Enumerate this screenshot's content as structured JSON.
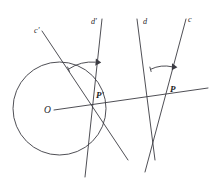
{
  "figure": {
    "width": 218,
    "height": 182,
    "background": "#ffffff",
    "stroke_color": "#3b3b42",
    "label_color": "#26262b"
  },
  "labels": {
    "line_c_prime": "c'",
    "line_d_prime": "d'",
    "line_d": "d",
    "line_c": "c",
    "point_o": "O",
    "point_p_prime": "P'",
    "point_p": "P"
  },
  "label_positions": {
    "line_c_prime": {
      "x": 34,
      "y": 33
    },
    "line_d_prime": {
      "x": 91,
      "y": 24
    },
    "line_d": {
      "x": 143,
      "y": 24
    },
    "line_c": {
      "x": 188,
      "y": 22
    },
    "point_o": {
      "x": 44,
      "y": 113
    },
    "point_p_prime": {
      "x": 96,
      "y": 98
    },
    "point_p": {
      "x": 170,
      "y": 92
    }
  },
  "geometry": {
    "circle": {
      "name": "circle-O",
      "center_x": 59.5,
      "center_y": 108.5,
      "radius": 46.5
    },
    "lines": [
      {
        "name": "line-c-prime",
        "label": "c'",
        "x1": 42,
        "y1": 31,
        "x2": 128,
        "y2": 160
      },
      {
        "name": "line-d-prime",
        "label": "d'",
        "x1": 102,
        "y1": 19,
        "x2": 85,
        "y2": 177
      },
      {
        "name": "line-d",
        "label": "d",
        "x1": 137,
        "y1": 19,
        "x2": 155,
        "y2": 160
      },
      {
        "name": "line-c",
        "label": "c",
        "x1": 186,
        "y1": 19,
        "x2": 145,
        "y2": 172
      },
      {
        "name": "line-op-horizontal",
        "label": "",
        "x1": 54,
        "y1": 110,
        "x2": 208,
        "y2": 88
      }
    ],
    "points": [
      {
        "name": "point-O",
        "label": "O",
        "x": 52,
        "y": 110
      },
      {
        "name": "point-P-prime",
        "label": "P'",
        "x": 92,
        "y": 104
      },
      {
        "name": "point-P",
        "label": "P",
        "x": 165,
        "y": 99
      }
    ],
    "angle_arcs": [
      {
        "name": "angle-arc-P-prime",
        "vertex_x": 92,
        "vertex_y": 104,
        "radius": 42,
        "start_angle_deg": 236,
        "end_angle_deg": 275,
        "arrow_at": "end"
      },
      {
        "name": "angle-arc-P",
        "vertex_x": 165,
        "vertex_y": 99,
        "radius": 33,
        "start_angle_deg": 244,
        "end_angle_deg": 283,
        "arrow_at": "end"
      }
    ]
  }
}
